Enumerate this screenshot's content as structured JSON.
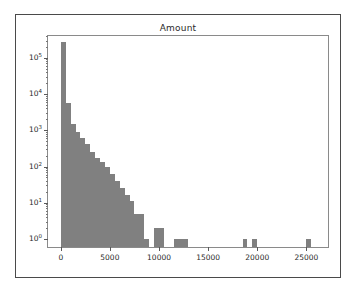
{
  "figure": {
    "title": "Amount",
    "bar_color": "#808080",
    "axis_color": "#8a8a8a",
    "frame_color": "#4a4a4a",
    "background": "#ffffff"
  },
  "chart_data": {
    "type": "bar",
    "subtype": "histogram",
    "title": "Amount",
    "xlabel": "",
    "ylabel": "",
    "yscale": "log",
    "xscale": "linear",
    "grid": false,
    "legend": null,
    "bin_width": 500,
    "xlim": [
      -1300,
      27200
    ],
    "ylim": [
      0.6,
      400000
    ],
    "xticks": [
      0,
      5000,
      10000,
      15000,
      20000,
      25000
    ],
    "xticklabels": [
      "0",
      "5000",
      "10000",
      "15000",
      "20000",
      "25000"
    ],
    "yticks": [
      1,
      10,
      100,
      1000,
      10000,
      100000
    ],
    "yticklabels": [
      "10^0",
      "10^1",
      "10^2",
      "10^3",
      "10^4",
      "10^5"
    ],
    "yticklabels_mantissa": [
      "10",
      "10",
      "10",
      "10",
      "10",
      "10"
    ],
    "yticklabels_exponent": [
      "0",
      "1",
      "2",
      "3",
      "4",
      "5"
    ],
    "bin_edges": [
      0,
      500,
      1000,
      1500,
      2000,
      2500,
      3000,
      3500,
      4000,
      4500,
      5000,
      5500,
      6000,
      6500,
      7000,
      7500,
      8000,
      8500,
      9000,
      9500,
      10000,
      10500,
      11000,
      11500,
      12000,
      12500,
      13000,
      13500,
      18500,
      19000,
      19500,
      20000,
      25000,
      25500
    ],
    "bars": [
      {
        "x0": 0,
        "x1": 500,
        "count": 280000
      },
      {
        "x0": 500,
        "x1": 1000,
        "count": 5800
      },
      {
        "x0": 1000,
        "x1": 1500,
        "count": 1500
      },
      {
        "x0": 1500,
        "x1": 2000,
        "count": 900
      },
      {
        "x0": 2000,
        "x1": 2500,
        "count": 600
      },
      {
        "x0": 2500,
        "x1": 3000,
        "count": 420
      },
      {
        "x0": 3000,
        "x1": 3500,
        "count": 250
      },
      {
        "x0": 3500,
        "x1": 4000,
        "count": 170
      },
      {
        "x0": 4000,
        "x1": 4500,
        "count": 130
      },
      {
        "x0": 4500,
        "x1": 5000,
        "count": 100
      },
      {
        "x0": 5000,
        "x1": 5500,
        "count": 62
      },
      {
        "x0": 5500,
        "x1": 6000,
        "count": 40
      },
      {
        "x0": 6000,
        "x1": 6500,
        "count": 26
      },
      {
        "x0": 6500,
        "x1": 7000,
        "count": 16
      },
      {
        "x0": 7000,
        "x1": 7500,
        "count": 11
      },
      {
        "x0": 7500,
        "x1": 8000,
        "count": 5
      },
      {
        "x0": 8000,
        "x1": 8500,
        "count": 5
      },
      {
        "x0": 8500,
        "x1": 9000,
        "count": 1
      },
      {
        "x0": 9500,
        "x1": 10000,
        "count": 2
      },
      {
        "x0": 10000,
        "x1": 10500,
        "count": 2
      },
      {
        "x0": 11500,
        "x1": 12000,
        "count": 1
      },
      {
        "x0": 12000,
        "x1": 12500,
        "count": 1
      },
      {
        "x0": 12500,
        "x1": 13000,
        "count": 1
      },
      {
        "x0": 18500,
        "x1": 19000,
        "count": 1
      },
      {
        "x0": 19500,
        "x1": 20000,
        "count": 1
      },
      {
        "x0": 25000,
        "x1": 25500,
        "count": 1
      }
    ]
  }
}
